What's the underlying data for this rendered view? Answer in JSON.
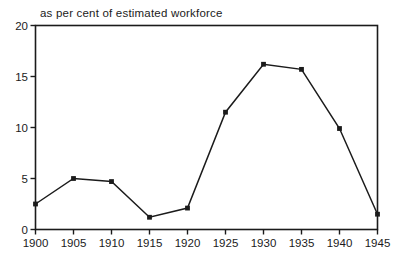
{
  "chart_data": {
    "type": "line",
    "title": "as per cent of estimated workforce",
    "categories": [
      "1900",
      "1905",
      "1910",
      "1915",
      "1920",
      "1925",
      "1930",
      "1935",
      "1940",
      "1945"
    ],
    "values": [
      2.5,
      5.0,
      4.7,
      1.2,
      2.1,
      11.5,
      16.2,
      15.7,
      9.9,
      1.5
    ],
    "xlabel": "",
    "ylabel": "",
    "ylim": [
      0,
      20
    ],
    "yticks": [
      0,
      5,
      10,
      15,
      20
    ],
    "grid": false,
    "legend_position": "none",
    "marker": "square",
    "line_color": "#1b1b1b",
    "axis_color": "#1b1b1b",
    "background_color": "#ffffff"
  }
}
